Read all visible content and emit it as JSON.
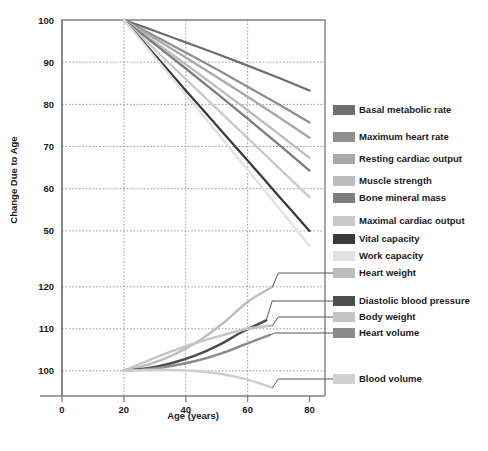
{
  "chart_data": {
    "type": "line",
    "title": "",
    "xlabel": "Age (years)",
    "ylabel": "Change Due to Age",
    "xlim": [
      0,
      85
    ],
    "xticks": [
      0,
      20,
      40,
      60,
      80
    ],
    "xtick_labels": [
      "0",
      "20",
      "40",
      "60",
      "80"
    ],
    "upper_panel": {
      "ylim": [
        45,
        100
      ],
      "yticks": [
        50,
        60,
        70,
        80,
        90,
        100
      ],
      "ytick_labels": [
        "50",
        "60",
        "70",
        "80",
        "90",
        "100"
      ]
    },
    "lower_panel": {
      "ylim": [
        94,
        124
      ],
      "yticks": [
        100,
        110,
        120
      ],
      "ytick_labels": [
        "100",
        "110",
        "120"
      ]
    },
    "grid": true,
    "legend_position": "right",
    "x": [
      20,
      30,
      40,
      50,
      60,
      70,
      80
    ],
    "series": [
      {
        "name": "Basal metabolic rate",
        "panel": "upper",
        "color": "#6e6e6e",
        "values": [
          100,
          97.4,
          94.7,
          92.0,
          89.2,
          86.3,
          83.3
        ]
      },
      {
        "name": "Maximum heart rate",
        "panel": "upper",
        "color": "#8f8f8f",
        "values": [
          100,
          96.2,
          92.3,
          88.3,
          84.2,
          80.0,
          75.7
        ]
      },
      {
        "name": "Resting cardiac output",
        "panel": "upper",
        "color": "#a8a8a8",
        "values": [
          100,
          95.6,
          91.1,
          86.5,
          81.8,
          77.0,
          72.1
        ]
      },
      {
        "name": "Muscle strength",
        "panel": "upper",
        "color": "#bcbcbc",
        "values": [
          100,
          94.8,
          89.5,
          84.1,
          78.6,
          73.0,
          67.3
        ]
      },
      {
        "name": "Bone mineral mass",
        "panel": "upper",
        "color": "#7d7d7d",
        "values": [
          100,
          94.3,
          88.5,
          82.6,
          76.6,
          70.5,
          64.3
        ]
      },
      {
        "name": "Maximal cardiac output",
        "panel": "upper",
        "color": "#c9c9c9",
        "values": [
          100,
          93.0,
          86.0,
          79.0,
          72.0,
          65.0,
          58.0
        ]
      },
      {
        "name": "Vital capacity",
        "panel": "upper",
        "color": "#3a3a3a",
        "values": [
          100,
          91.7,
          83.3,
          75.0,
          66.7,
          58.3,
          50.0
        ]
      },
      {
        "name": "Work capacity",
        "panel": "upper",
        "color": "#e2e2e2",
        "values": [
          100,
          91.2,
          82.3,
          73.4,
          64.5,
          55.5,
          46.5
        ]
      },
      {
        "name": "Heart weight",
        "panel": "lower",
        "color": "#bdbdbd",
        "values": [
          100,
          101.5,
          103.8,
          107.0,
          111.3,
          116.4,
          120.0
        ],
        "endpoint_x": 68
      },
      {
        "name": "Diastolic blood pressure",
        "panel": "lower",
        "color": "#4d4d4d",
        "values": [
          100,
          100.6,
          101.8,
          103.6,
          106.1,
          109.3,
          112.0
        ],
        "endpoint_x": 66
      },
      {
        "name": "Body weight",
        "panel": "lower",
        "color": "#c4c4c4",
        "values": [
          100,
          102.5,
          104.8,
          106.8,
          108.5,
          110.0,
          110.8
        ],
        "endpoint_x": 68
      },
      {
        "name": "Heart volume",
        "panel": "lower",
        "color": "#8c8c8c",
        "values": [
          100,
          100.4,
          101.2,
          102.4,
          104.1,
          106.3,
          108.5
        ],
        "endpoint_x": 67
      },
      {
        "name": "Blood volume",
        "panel": "lower",
        "color": "#cfcfcf",
        "values": [
          100,
          100.2,
          100.2,
          99.9,
          99.2,
          97.9,
          96.0
        ],
        "endpoint_x": 68
      }
    ],
    "legend_entries": [
      {
        "label": "Basal metabolic rate",
        "color": "#6e6e6e",
        "y": 110
      },
      {
        "label": "Maximum heart rate",
        "color": "#8f8f8f",
        "y": 137
      },
      {
        "label": "Resting cardiac output",
        "color": "#a8a8a8",
        "y": 159
      },
      {
        "label": "Muscle strength",
        "color": "#bcbcbc",
        "y": 181
      },
      {
        "label": "Bone mineral mass",
        "color": "#7d7d7d",
        "y": 198
      },
      {
        "label": "Maximal cardiac output",
        "color": "#c9c9c9",
        "y": 221
      },
      {
        "label": "Vital capacity",
        "color": "#3a3a3a",
        "y": 239
      },
      {
        "label": "Work capacity",
        "color": "#e2e2e2",
        "y": 256
      },
      {
        "label": "Heart weight",
        "color": "#bdbdbd",
        "y": 273
      },
      {
        "label": "Diastolic blood pressure",
        "color": "#4d4d4d",
        "y": 301
      },
      {
        "label": "Body weight",
        "color": "#c4c4c4",
        "y": 317
      },
      {
        "label": "Heart volume",
        "color": "#8c8c8c",
        "y": 333
      },
      {
        "label": "Blood volume",
        "color": "#cfcfcf",
        "y": 379
      }
    ]
  },
  "colors": {
    "axis": "#808080",
    "grid": "#9a9a9a",
    "text": "#1a1a1a",
    "background": "#ffffff"
  }
}
